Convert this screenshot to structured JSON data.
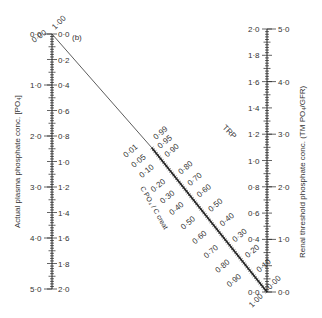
{
  "panel_label": "(b)",
  "left_axis": {
    "title": "Actual plasma phosphate conc. [PO₄]",
    "left_ticks": [
      "0·0",
      "1·0",
      "2·0",
      "3·0",
      "4·0",
      "5·0"
    ],
    "right_ticks": [
      "0·0",
      "0·2",
      "0·4",
      "0·6",
      "0·8",
      "1·0",
      "1·2",
      "1·4",
      "1·6",
      "1·8",
      "2·0"
    ],
    "top_diag_labels": [
      "0·00",
      "1·00"
    ]
  },
  "right_axis": {
    "title": "Renal threshold phosphate conc. (TM PO₄/GFR)",
    "left_ticks": [
      "2·0",
      "1·8",
      "1·6",
      "1·4",
      "1·2",
      "1·0",
      "0·8",
      "0·6",
      "0·4",
      "0·0"
    ],
    "right_ticks": [
      "5·0",
      "4·0",
      "3·0",
      "2·0",
      "1·0",
      "0·0"
    ],
    "bottom_diag_labels": [
      "0·00",
      "1·00"
    ]
  },
  "diagonal_scale": {
    "upper_label": "TRP",
    "lower_label": "C PO₄ / C creat",
    "upper_ticks": [
      "0·95",
      "0·90",
      "0·80",
      "0·70",
      "0·60",
      "0·50",
      "0·40",
      "0·30",
      "0·20",
      "0·10"
    ],
    "lower_ticks": [
      "0·01",
      "0·05",
      "0·10",
      "0·20",
      "0·30",
      "0·40",
      "0·50",
      "0·60",
      "0·70",
      "0·80",
      "0·90"
    ],
    "extra_top": "0·99"
  }
}
